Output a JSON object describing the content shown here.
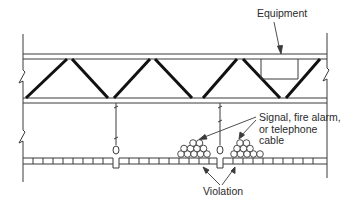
{
  "diagram": {
    "type": "cross-section",
    "labels": {
      "equipment": "Equipment",
      "cable_line1": "Signal, fire alarm,",
      "cable_line2": "or telephone",
      "cable_line3": "cable",
      "violation": "Violation"
    },
    "colors": {
      "line": "#3a3a3a",
      "truss_member": "#111111",
      "background": "#ffffff",
      "text": "#2a2a2a"
    },
    "elements": [
      "left-wall",
      "right-wall",
      "top-chord",
      "bottom-chord",
      "truss-web",
      "equipment-box",
      "hanger-wire-left",
      "hanger-wire-right",
      "suspended-ceiling-grid",
      "cable-bundle-left",
      "cable-bundle-right"
    ]
  }
}
